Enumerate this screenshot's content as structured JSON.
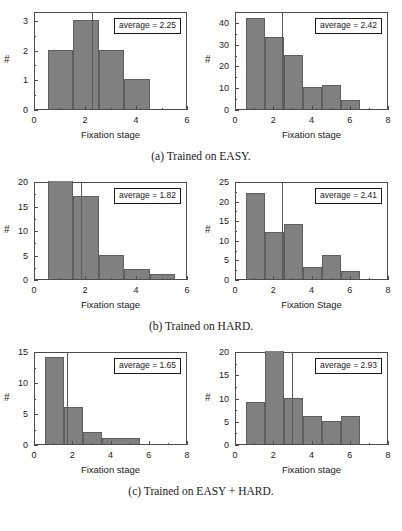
{
  "figure": {
    "rows": [
      {
        "caption": "(a) Trained on EASY.",
        "panels": [
          {
            "annotation": "average = 2.25",
            "xlabel": "Fixation stage",
            "ylabel": "#"
          },
          {
            "annotation": "average = 2.42",
            "xlabel": "Fixation stage",
            "ylabel": "#"
          }
        ]
      },
      {
        "caption": "(b) Trained on HARD.",
        "panels": [
          {
            "annotation": "average = 1.82",
            "xlabel": "Fixation stage",
            "ylabel": "#"
          },
          {
            "annotation": "average = 2.41",
            "xlabel": "Fixation Stage",
            "ylabel": "#"
          }
        ]
      },
      {
        "caption": "(c) Trained on EASY + HARD.",
        "panels": [
          {
            "annotation": "average = 1.65",
            "xlabel": "Fixation stage",
            "ylabel": "#"
          },
          {
            "annotation": "average = 2.93",
            "xlabel": "Fixation stage",
            "ylabel": "#"
          }
        ]
      }
    ]
  },
  "style": {
    "bar_color": "#808080",
    "bar_edge_color": "#5e5e5e",
    "axis_color": "#4d4d4d",
    "avg_line_color": "#5a5a5a",
    "background": "#ffffff"
  },
  "chart_data": [
    {
      "id": "easy-left",
      "type": "bar",
      "title": "",
      "xlabel": "Fixation stage",
      "ylabel": "#",
      "xlim": [
        0,
        6
      ],
      "ylim": [
        0,
        3.3
      ],
      "xticks": [
        0,
        2,
        4,
        6
      ],
      "yticks": [
        0,
        1,
        2,
        3
      ],
      "grid": false,
      "bin_edges": [
        0.5,
        1.5,
        2.5,
        3.5,
        4.5
      ],
      "bin_centers": [
        1,
        2,
        3,
        4
      ],
      "values": [
        2,
        3,
        2,
        1
      ],
      "average": 2.25,
      "annotation": "average = 2.25",
      "clipped_bars": []
    },
    {
      "id": "easy-right",
      "type": "bar",
      "title": "",
      "xlabel": "Fixation stage",
      "ylabel": "#",
      "xlim": [
        0,
        8
      ],
      "ylim": [
        0,
        45
      ],
      "xticks": [
        0,
        2,
        4,
        6,
        8
      ],
      "yticks": [
        0,
        10,
        20,
        30,
        40
      ],
      "grid": false,
      "bin_edges": [
        0.5,
        1.5,
        2.5,
        3.5,
        4.5,
        5.5,
        6.5
      ],
      "bin_centers": [
        1,
        2,
        3,
        4,
        5,
        6
      ],
      "values": [
        42,
        33,
        25,
        10,
        11,
        4
      ],
      "average": 2.42,
      "annotation": "average = 2.42",
      "clipped_bars": []
    },
    {
      "id": "hard-left",
      "type": "bar",
      "title": "",
      "xlabel": "Fixation stage",
      "ylabel": "#",
      "xlim": [
        0,
        6
      ],
      "ylim": [
        0,
        20
      ],
      "xticks": [
        0,
        2,
        4,
        6
      ],
      "yticks": [
        0,
        5,
        10,
        15,
        20
      ],
      "grid": false,
      "bin_edges": [
        0.5,
        1.5,
        2.5,
        3.5,
        4.5,
        5.5
      ],
      "bin_centers": [
        1,
        2,
        3,
        4,
        5
      ],
      "values": [
        20,
        17,
        5,
        2,
        1
      ],
      "average": 1.82,
      "annotation": "average = 1.82",
      "clipped_bars": [
        0
      ]
    },
    {
      "id": "hard-right",
      "type": "bar",
      "title": "",
      "xlabel": "Fixation Stage",
      "ylabel": "#",
      "xlim": [
        0,
        8
      ],
      "ylim": [
        0,
        25
      ],
      "xticks": [
        0,
        2,
        4,
        6,
        8
      ],
      "yticks": [
        0,
        5,
        10,
        15,
        20,
        25
      ],
      "grid": false,
      "bin_edges": [
        0.5,
        1.5,
        2.5,
        3.5,
        4.5,
        5.5,
        6.5
      ],
      "bin_centers": [
        1,
        2,
        3,
        4,
        5,
        6
      ],
      "values": [
        22,
        12,
        14,
        3,
        6,
        2
      ],
      "average": 2.41,
      "annotation": "average = 2.41",
      "clipped_bars": []
    },
    {
      "id": "easyhard-left",
      "type": "bar",
      "title": "",
      "xlabel": "Fixation stage",
      "ylabel": "#",
      "xlim": [
        0,
        8
      ],
      "ylim": [
        0,
        15
      ],
      "xticks": [
        0,
        2,
        4,
        6,
        8
      ],
      "yticks": [
        0,
        5,
        10,
        15
      ],
      "grid": false,
      "bin_edges": [
        0.5,
        1.5,
        2.5,
        3.5,
        5.5,
        6.5
      ],
      "bin_centers": [
        1,
        2,
        3,
        6
      ],
      "values": [
        14,
        6,
        2,
        1
      ],
      "average": 1.65,
      "annotation": "average = 1.65",
      "clipped_bars": []
    },
    {
      "id": "easyhard-right",
      "type": "bar",
      "title": "",
      "xlabel": "Fixation stage",
      "ylabel": "#",
      "xlim": [
        0,
        8
      ],
      "ylim": [
        0,
        20
      ],
      "xticks": [
        0,
        2,
        4,
        6,
        8
      ],
      "yticks": [
        0,
        5,
        10,
        15,
        20
      ],
      "grid": false,
      "bin_edges": [
        0.5,
        1.5,
        2.5,
        3.5,
        4.5,
        5.5,
        6.5
      ],
      "bin_centers": [
        1,
        2,
        3,
        4,
        5,
        6
      ],
      "values": [
        9,
        20,
        10,
        6,
        5,
        6
      ],
      "average": 2.93,
      "annotation": "average = 2.93",
      "clipped_bars": [
        1
      ]
    }
  ]
}
